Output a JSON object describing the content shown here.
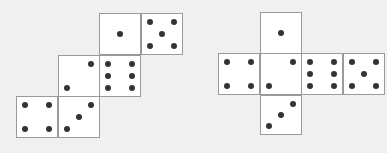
{
  "colors": {
    "background": "#f0f0f0",
    "face": "#ffffff",
    "edge": "#9a9a9a",
    "pip": "#333333"
  },
  "nets": [
    {
      "name": "left-net",
      "faces": [
        {
          "row": 0,
          "col": 2,
          "value": 1
        },
        {
          "row": 0,
          "col": 3,
          "value": 5
        },
        {
          "row": 1,
          "col": 1,
          "value": 2
        },
        {
          "row": 1,
          "col": 2,
          "value": 6
        },
        {
          "row": 2,
          "col": 0,
          "value": 4
        },
        {
          "row": 2,
          "col": 1,
          "value": 3
        }
      ]
    },
    {
      "name": "right-net",
      "faces": [
        {
          "row": 0,
          "col": 1,
          "value": 1
        },
        {
          "row": 1,
          "col": 0,
          "value": 4
        },
        {
          "row": 1,
          "col": 1,
          "value": 2
        },
        {
          "row": 1,
          "col": 2,
          "value": 6
        },
        {
          "row": 1,
          "col": 3,
          "value": 5
        },
        {
          "row": 2,
          "col": 1,
          "value": 3
        }
      ]
    }
  ]
}
